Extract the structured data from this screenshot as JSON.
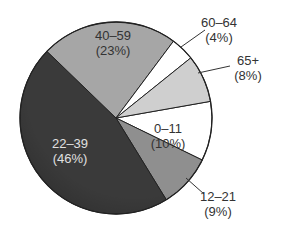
{
  "chart_data": {
    "type": "pie",
    "title": "",
    "start_angle_deg": -10,
    "direction": "clockwise",
    "center": [
      116,
      118
    ],
    "radius": 96,
    "slices": [
      {
        "label": "0–11",
        "pct_label": "(10%)",
        "value": 10,
        "color": "#ffffff",
        "text_color": "#333333",
        "label_pos": [
          168,
          133
        ],
        "leader": null
      },
      {
        "label": "12–21",
        "pct_label": "(9%)",
        "value": 9,
        "color": "#8f8f8f",
        "text_color": "#333333",
        "label_pos": [
          218,
          201
        ],
        "leader": [
          [
            186,
            178
          ],
          [
            204,
            194
          ]
        ]
      },
      {
        "label": "22–39",
        "pct_label": "(46%)",
        "value": 46,
        "color": "#3a3a3a",
        "text_color": "#e0e0e0",
        "label_pos": [
          70,
          148
        ],
        "leader": null
      },
      {
        "label": "40–59",
        "pct_label": "(23%)",
        "value": 23,
        "color": "#a6a6a6",
        "text_color": "#333333",
        "label_pos": [
          113,
          40
        ],
        "leader": null
      },
      {
        "label": "60–64",
        "pct_label": "(4%)",
        "value": 4,
        "color": "#ffffff",
        "text_color": "#333333",
        "label_pos": [
          219,
          27
        ],
        "leader": [
          [
            181,
            47
          ],
          [
            205,
            30
          ]
        ]
      },
      {
        "label": "65+",
        "pct_label": "(8%)",
        "value": 8,
        "color": "#cfcfcf",
        "text_color": "#333333",
        "label_pos": [
          248,
          65
        ],
        "leader": [
          [
            198,
            73
          ],
          [
            230,
            66
          ]
        ]
      }
    ],
    "legend": null,
    "grid": false
  }
}
